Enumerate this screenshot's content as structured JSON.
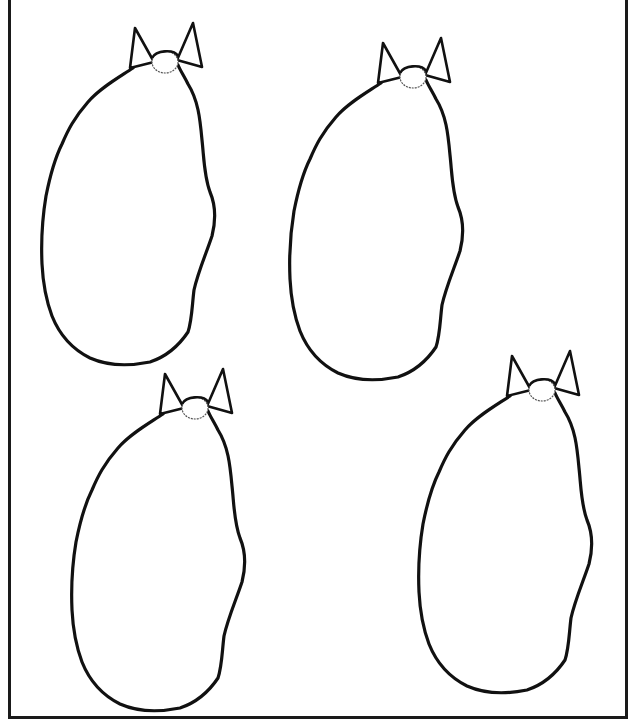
{
  "page": {
    "stroke_color": "#111111",
    "background": "#ffffff"
  },
  "bags": [
    {
      "id": "bag-1",
      "label": "Bag outline 1",
      "x": 38,
      "y": 20
    },
    {
      "id": "bag-2",
      "label": "Bag outline 2",
      "x": 286,
      "y": 35
    },
    {
      "id": "bag-3",
      "label": "Bag outline 3",
      "x": 68,
      "y": 366
    },
    {
      "id": "bag-4",
      "label": "Bag outline 4",
      "x": 415,
      "y": 348
    }
  ]
}
